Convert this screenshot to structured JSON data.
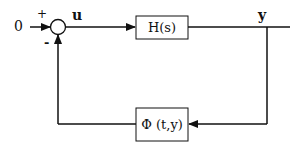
{
  "diagram": {
    "type": "feedback-loop-block-diagram",
    "input": {
      "label": "0"
    },
    "summing_junction": {
      "plus_sign": "+",
      "minus_sign": "-"
    },
    "signals": {
      "u": "u",
      "y": "y"
    },
    "forward_block": {
      "label": "H(s)"
    },
    "feedback_block": {
      "label": "Φ (t,y)"
    },
    "color": "#111111"
  }
}
